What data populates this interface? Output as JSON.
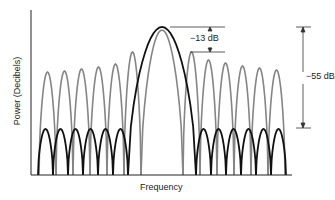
{
  "chart_data": {
    "type": "line",
    "title": "",
    "xlabel": "Frequency",
    "ylabel": "Power (Decibels)",
    "grid": false,
    "legend": null,
    "annotations": [
      {
        "text": "−13 dB",
        "meaning": "first sidelobe level of unweighted (gray) spectrum relative to main lobe peak"
      },
      {
        "text": "−55 dB",
        "meaning": "sidelobe level of weighted (black) spectrum relative to main lobe peak"
      }
    ],
    "series": [
      {
        "name": "unweighted",
        "color": "#808080",
        "main_lobe": {
          "center_px": 162,
          "half_width_px": 21,
          "peak_y_px": 30
        },
        "sidelobe_width_px": 17,
        "sidelobe_peaks_y_px_left": [
          73,
          72,
          71,
          69,
          67,
          64,
          52
        ],
        "sidelobe_peaks_y_px_right": [
          52,
          60,
          63,
          66,
          68,
          70,
          72
        ]
      },
      {
        "name": "weighted",
        "color": "#111111",
        "main_lobe": {
          "center_px": 162,
          "half_width_px": 34,
          "peak_y_px": 27
        },
        "sidelobe_width_px": 15,
        "sidelobe_peaks_y_px": 129
      }
    ],
    "axes": {
      "origin_px": [
        31,
        175
      ],
      "x_end_px": 292,
      "y_top_px": 10
    }
  },
  "labels": {
    "ylabel": "Power (Decibels)",
    "xlabel": "Frequency",
    "ann13": "−13 dB",
    "ann55": "−55 dB"
  }
}
